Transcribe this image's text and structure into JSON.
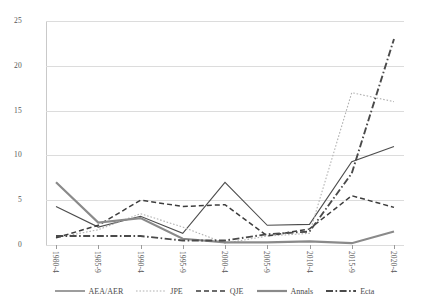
{
  "chart_data": {
    "type": "line",
    "title": "",
    "xlabel": "",
    "ylabel": "",
    "ylim": [
      0,
      25
    ],
    "yticks": [
      0,
      5,
      10,
      15,
      20,
      25
    ],
    "grid": true,
    "legend_position": "bottom",
    "categories": [
      "1980-4",
      "1985-9",
      "1990-4",
      "1995-9",
      "2000-4",
      "2005-9",
      "2010-4",
      "2015-9",
      "2020-4"
    ],
    "series": [
      {
        "name": "AEA/AER",
        "style": "solid",
        "color": "#4d4d4d",
        "values": [
          4.3,
          2.0,
          3.2,
          1.3,
          7.0,
          2.2,
          2.3,
          9.3,
          11.0
        ]
      },
      {
        "name": "JPE",
        "style": "dotted",
        "color": "#b2b2b2",
        "values": [
          0.8,
          1.7,
          3.5,
          2.0,
          0.2,
          1.0,
          1.3,
          17.0,
          16.0
        ]
      },
      {
        "name": "QJE",
        "style": "dashed",
        "color": "#3d3d3d",
        "values": [
          0.8,
          2.2,
          5.0,
          4.3,
          4.5,
          1.0,
          1.8,
          5.5,
          4.2
        ]
      },
      {
        "name": "Annals",
        "style": "solid-thick",
        "color": "#8a8a8a",
        "values": [
          7.0,
          2.5,
          3.0,
          0.7,
          0.3,
          0.3,
          0.4,
          0.2,
          1.5
        ]
      },
      {
        "name": "Ecta",
        "style": "dash-dot",
        "color": "#4a4a4a",
        "values": [
          1.0,
          1.0,
          1.0,
          0.5,
          0.5,
          1.2,
          1.5,
          8.0,
          23.0
        ]
      }
    ]
  },
  "axes": {
    "ytick_labels": [
      "0",
      "5",
      "10",
      "15",
      "20",
      "25"
    ],
    "xtick_labels": [
      "1980-4",
      "1985-9",
      "1990-4",
      "1995-9",
      "2000-4",
      "2005-9",
      "2010-4",
      "2015-9",
      "2020-4"
    ]
  },
  "legend": {
    "items": [
      {
        "label": "AEA/AER"
      },
      {
        "label": "JPE"
      },
      {
        "label": "QJE"
      },
      {
        "label": "Annals"
      },
      {
        "label": "Ecta"
      }
    ]
  }
}
